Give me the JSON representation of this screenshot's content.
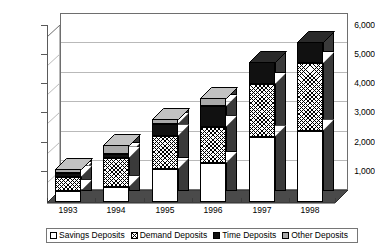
{
  "chart_data": {
    "type": "bar",
    "subtype": "stacked-column-3d",
    "title": "",
    "xlabel": "",
    "ylabel": "",
    "ylim": [
      0,
      6000
    ],
    "ytick_step": 1000,
    "grid": true,
    "legend_position": "bottom",
    "categories": [
      "1993",
      "1994",
      "1995",
      "1996",
      "1997",
      "1998"
    ],
    "ytick_labels": [
      "6,000",
      "5,000",
      "4,000",
      "3,000",
      "2,000",
      "1,000"
    ],
    "ytick_values": [
      6000,
      5000,
      4000,
      3000,
      2000,
      1000
    ],
    "series": [
      {
        "name": "Savings Deposits",
        "fill": "white",
        "values": [
          380,
          520,
          1120,
          1320,
          2220,
          2420
        ]
      },
      {
        "name": "Demand Deposits",
        "fill": "crosshatch",
        "values": [
          480,
          980,
          1130,
          1230,
          1780,
          2280
        ]
      },
      {
        "name": "Time Deposits",
        "fill": "black",
        "values": [
          130,
          130,
          400,
          700,
          760,
          720
        ]
      },
      {
        "name": "Other Deposits",
        "fill": "gray",
        "values": [
          130,
          290,
          160,
          260,
          0,
          0
        ]
      }
    ],
    "totals": [
      1120,
      1920,
      2810,
      3510,
      4760,
      5420
    ]
  },
  "legend": {
    "items": [
      {
        "label": "Savings Deposits",
        "swatch": "white-swatch"
      },
      {
        "label": "Demand Deposits",
        "swatch": "crosshatch-swatch"
      },
      {
        "label": "Time Deposits",
        "swatch": "black-swatch"
      },
      {
        "label": "Other Deposits",
        "swatch": "gray-swatch"
      }
    ]
  }
}
